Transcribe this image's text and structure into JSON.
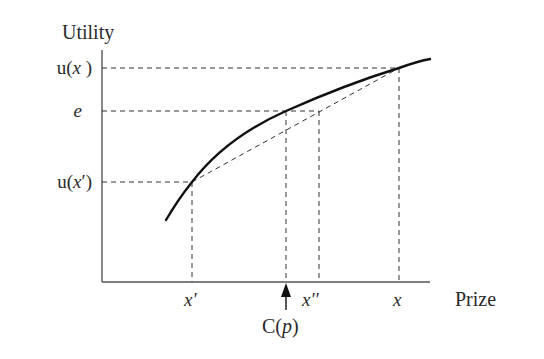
{
  "diagram": {
    "type": "expected-utility-certainty-equivalent",
    "y_axis_title": "Utility",
    "x_axis_title": "Prize",
    "y_labels": {
      "u_x": "u(x )",
      "e": "e",
      "u_x_prime": "u(x′)"
    },
    "x_labels": {
      "x_prime": "x′",
      "x_double_prime": "x′′",
      "x": "x",
      "certainty_equivalent": "C(p)"
    },
    "colors": {
      "axis": "#555555",
      "curve": "#111111",
      "dashed": "#333333",
      "text": "#2a2a2a"
    },
    "geometry": {
      "origin": [
        102,
        282
      ],
      "y_axis_top": 50,
      "x_axis_right": 430,
      "points": {
        "x_prime": [
          192,
          182
        ],
        "c_p": [
          286,
          111
        ],
        "x_double_prime": [
          319,
          111
        ],
        "x": [
          399,
          68
        ],
        "chord_at_c_p": [
          286,
          132
        ]
      },
      "curve_start": [
        166,
        220
      ],
      "curve_end": [
        430,
        59
      ]
    },
    "elements": [
      "concave utility curve",
      "dashed chord from (x′, u(x′)) to (x, u(x))",
      "horizontal dashed guides at u(x), e, u(x′)",
      "vertical dashed guides at x′, C(p), x′′, x",
      "arrow pointing up to C(p) on the prize axis"
    ]
  }
}
